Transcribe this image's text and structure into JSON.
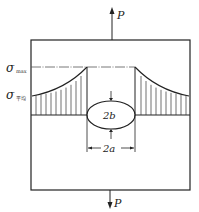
{
  "diagram": {
    "load_top": {
      "label": "P",
      "direction": "up"
    },
    "load_bottom": {
      "label": "P",
      "direction": "down"
    },
    "stress_labels": {
      "max": {
        "symbol": "σ",
        "subscript": "max"
      },
      "avg": {
        "symbol": "σ",
        "subscript": "平均"
      }
    },
    "hole": {
      "shape": "ellipse",
      "height_label": "2b",
      "width_label": "2a"
    },
    "colors": {
      "line": "#222222",
      "background": "#ffffff"
    }
  }
}
